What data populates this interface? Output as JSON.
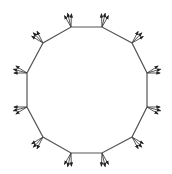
{
  "diagram": {
    "type": "polygon-with-vertex-vectors",
    "shape": "dodecagon",
    "sides": 12,
    "center": [
      87,
      90
    ],
    "stroke_color": "#555555",
    "arrow_color": "#222222",
    "background": "#ffffff",
    "arrows_per_vertex": 3,
    "arrow_length": 14,
    "arrow_spread_deg": 16,
    "vertices": [
      [
        71,
        27
      ],
      [
        102,
        27
      ],
      [
        132,
        43
      ],
      [
        147,
        73
      ],
      [
        147,
        107
      ],
      [
        132,
        137
      ],
      [
        102,
        153
      ],
      [
        71,
        153
      ],
      [
        43,
        137
      ],
      [
        27,
        107
      ],
      [
        27,
        73
      ],
      [
        43,
        43
      ]
    ]
  }
}
